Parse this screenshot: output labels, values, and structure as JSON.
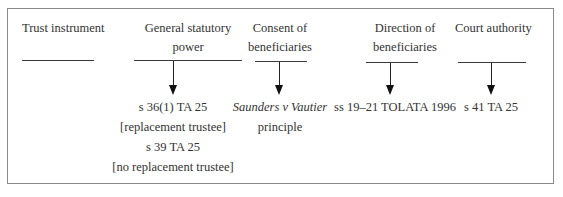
{
  "diagram": {
    "columns": [
      {
        "id": "trust-instrument",
        "heading": [
          "Trust instrument"
        ],
        "has_arrow": false,
        "results": []
      },
      {
        "id": "general-statutory-power",
        "heading": [
          "General statutory",
          "power"
        ],
        "has_arrow": true,
        "results": [
          {
            "text": "s 36(1) TA 25",
            "italic": false
          },
          {
            "text": "[replacement trustee]",
            "italic": false
          },
          {
            "text": "s 39 TA 25",
            "italic": false
          },
          {
            "text": "[no replacement trustee]",
            "italic": false
          }
        ]
      },
      {
        "id": "consent-of-beneficiaries",
        "heading": [
          "Consent of",
          "beneficiaries"
        ],
        "has_arrow": true,
        "results": [
          {
            "text": "Saunders v Vautier",
            "italic": true
          },
          {
            "text": "principle",
            "italic": false
          }
        ]
      },
      {
        "id": "direction-of-beneficiaries",
        "heading": [
          "Direction of",
          "beneficiaries"
        ],
        "has_arrow": true,
        "results": [
          {
            "text": "ss 19–21 TOLATA 1996",
            "italic": false
          }
        ]
      },
      {
        "id": "court-authority",
        "heading": [
          "Court authority"
        ],
        "has_arrow": true,
        "results": [
          {
            "text": "s 41 TA 25",
            "italic": false
          }
        ]
      }
    ],
    "colors": {
      "frame": "#8a8a8a",
      "line": "#3a3a3a",
      "arrow": "#111111",
      "text": "#333333"
    }
  }
}
